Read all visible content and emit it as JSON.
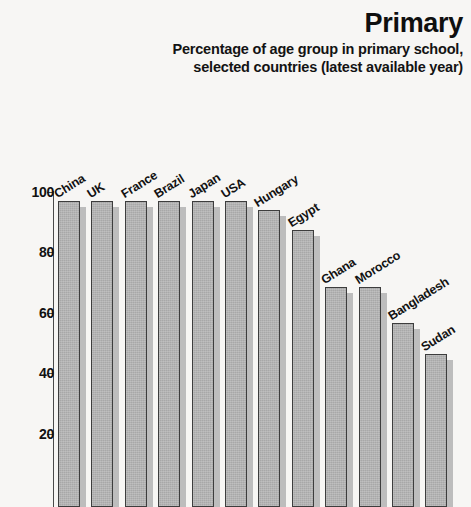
{
  "header": {
    "title": "Primary",
    "subtitle": "Percentage of age group in primary school, selected countries (latest available year)"
  },
  "axis": {
    "ticks": [
      {
        "label": "100",
        "value": 100
      },
      {
        "label": "80",
        "value": 80
      },
      {
        "label": "60",
        "value": 60
      },
      {
        "label": "40",
        "value": 40
      },
      {
        "label": "20",
        "value": 20
      }
    ]
  },
  "chart_data": {
    "type": "bar",
    "title": "Primary",
    "subtitle": "Percentage of age group in primary school, selected countries (latest available year)",
    "xlabel": "",
    "ylabel": "",
    "ylim": [
      0,
      100
    ],
    "ytick_labels": [
      "20",
      "40",
      "60",
      "80",
      "100"
    ],
    "ytick_values": [
      20,
      40,
      60,
      80,
      100
    ],
    "grid": false,
    "legend": false,
    "orientation": "vertical",
    "bar_style": "3d-shadow",
    "categories": [
      "China",
      "UK",
      "France",
      "Brazil",
      "Japan",
      "USA",
      "Hungary",
      "Egypt",
      "Ghana",
      "Morocco",
      "Bangladesh",
      "Sudan"
    ],
    "values": [
      97,
      97,
      97,
      97,
      97,
      97,
      94,
      87.5,
      68.5,
      68.5,
      56.5,
      46.5
    ]
  },
  "colors": {
    "background": "#f7f6f4",
    "bar_fill": "#a8a8a8",
    "bar_shadow": "#bdbdbd",
    "bar_outline": "#3d3d3d",
    "text": "#111111",
    "axis": "#4a4a4a"
  }
}
